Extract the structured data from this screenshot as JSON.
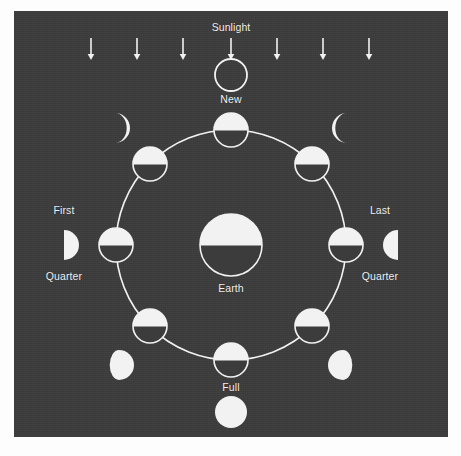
{
  "figure": {
    "background_color": "#3c3c3c",
    "ink_color": "#f2f2f2",
    "page_color": "#fdfdfd"
  },
  "labels": {
    "sunlight": "Sunlight",
    "new": "New",
    "first": "First",
    "first_quarter": "Quarter",
    "last": "Last",
    "last_quarter": "Quarter",
    "earth": "Earth",
    "full": "Full"
  },
  "sunlight_arrows": {
    "name": "sunlight-arrow",
    "count": 7,
    "direction": "down",
    "x_positions": [
      91,
      137,
      183,
      231,
      277,
      323,
      369
    ],
    "y_top": 38,
    "y_bottom": 60
  },
  "earth": {
    "name": "earth-body",
    "cx": 231,
    "cy": 245,
    "r": 31,
    "lit_half": "top",
    "label": "Earth"
  },
  "orbit": {
    "name": "moon-orbit-path",
    "cx": 231,
    "cy": 245,
    "r": 115,
    "stroke": "#f2f2f2",
    "stroke_width": 1.6
  },
  "orbit_moons": [
    {
      "name": "orbit-moon-new",
      "angle_deg": 270,
      "cx": 231,
      "cy": 130,
      "r": 17,
      "lit_half": "top"
    },
    {
      "name": "orbit-moon-waxing-crescent",
      "angle_deg": 225,
      "cx": 150,
      "cy": 164,
      "r": 17,
      "lit_half": "top"
    },
    {
      "name": "orbit-moon-first-quarter",
      "angle_deg": 180,
      "cx": 116,
      "cy": 245,
      "r": 17,
      "lit_half": "top"
    },
    {
      "name": "orbit-moon-waxing-gibbous",
      "angle_deg": 135,
      "cx": 150,
      "cy": 326,
      "r": 17,
      "lit_half": "top"
    },
    {
      "name": "orbit-moon-full",
      "angle_deg": 90,
      "cx": 231,
      "cy": 360,
      "r": 17,
      "lit_half": "top"
    },
    {
      "name": "orbit-moon-waning-gibbous",
      "angle_deg": 45,
      "cx": 312,
      "cy": 326,
      "r": 17,
      "lit_half": "top"
    },
    {
      "name": "orbit-moon-last-quarter",
      "angle_deg": 0,
      "cx": 346,
      "cy": 245,
      "r": 17,
      "lit_half": "top"
    },
    {
      "name": "orbit-moon-waning-crescent",
      "angle_deg": 315,
      "cx": 312,
      "cy": 164,
      "r": 17,
      "lit_half": "top"
    }
  ],
  "phase_icons": [
    {
      "name": "phase-icon-new",
      "phase": "New",
      "cx": 231,
      "cy": 75,
      "r": 16,
      "appearance": "outline-only",
      "label": "New"
    },
    {
      "name": "phase-icon-waxing-crescent",
      "phase": "Waxing Crescent",
      "cx": 115,
      "cy": 128,
      "r": 15,
      "appearance": "crescent-right-lit",
      "label": ""
    },
    {
      "name": "phase-icon-first-quarter",
      "phase": "First Quarter",
      "cx": 64,
      "cy": 245,
      "r": 15,
      "appearance": "half-right-lit",
      "label": "First Quarter"
    },
    {
      "name": "phase-icon-waxing-gibbous",
      "phase": "Waxing Gibbous",
      "cx": 119,
      "cy": 365,
      "r": 15,
      "appearance": "gibbous-right-lit",
      "label": ""
    },
    {
      "name": "phase-icon-full",
      "phase": "Full",
      "cx": 231,
      "cy": 412,
      "r": 16,
      "appearance": "full-lit",
      "label": "Full"
    },
    {
      "name": "phase-icon-waning-gibbous",
      "phase": "Waning Gibbous",
      "cx": 343,
      "cy": 365,
      "r": 15,
      "appearance": "gibbous-left-lit",
      "label": ""
    },
    {
      "name": "phase-icon-last-quarter",
      "phase": "Last Quarter",
      "cx": 398,
      "cy": 245,
      "r": 15,
      "appearance": "half-left-lit",
      "label": "Last Quarter"
    },
    {
      "name": "phase-icon-waning-crescent",
      "phase": "Waning Crescent",
      "cx": 347,
      "cy": 128,
      "r": 15,
      "appearance": "crescent-left-lit",
      "label": ""
    }
  ],
  "label_positions": {
    "sunlight": {
      "x": 231,
      "y": 27,
      "align": "center"
    },
    "new": {
      "x": 231,
      "y": 99,
      "align": "center"
    },
    "first": {
      "x": 64,
      "y": 210,
      "align": "center"
    },
    "first_quarter": {
      "x": 64,
      "y": 276,
      "align": "center"
    },
    "last": {
      "x": 380,
      "y": 210,
      "align": "center"
    },
    "last_quarter": {
      "x": 380,
      "y": 276,
      "align": "center"
    },
    "earth": {
      "x": 231,
      "y": 288,
      "align": "center"
    },
    "full": {
      "x": 231,
      "y": 387,
      "align": "center"
    }
  }
}
